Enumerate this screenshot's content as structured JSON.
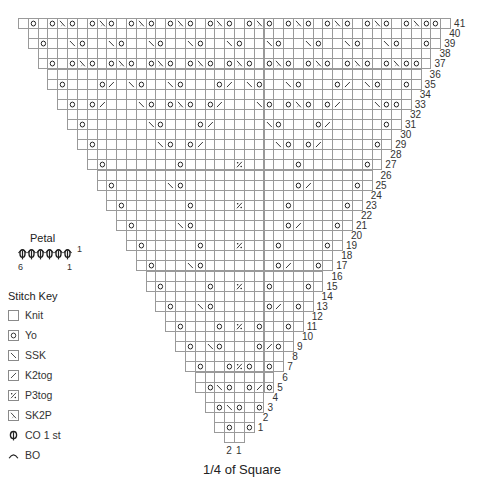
{
  "caption": "1/4 of Square",
  "petal": {
    "title": "Petal",
    "stitch_count": 6,
    "row_label": "1",
    "left_label": "6",
    "right_label": "1"
  },
  "stitch_key": {
    "title": "Stitch Key",
    "items": [
      {
        "symbol": "knit",
        "label": "Knit"
      },
      {
        "symbol": "yo",
        "label": "Yo"
      },
      {
        "symbol": "ssk",
        "label": "SSK"
      },
      {
        "symbol": "k2tog",
        "label": "K2tog"
      },
      {
        "symbol": "p3tog",
        "label": "P3tog"
      },
      {
        "symbol": "sk2p",
        "label": "SK2P"
      },
      {
        "symbol": "co1",
        "label": "CO 1 st"
      },
      {
        "symbol": "bo",
        "label": "BO"
      }
    ]
  },
  "chart": {
    "total_rows": 41,
    "bottom_row_cells": 2,
    "bottom_col_labels": [
      "2",
      "1"
    ],
    "symbols_legend": {
      "O": "yo",
      "S": "ssk",
      "K": "k2tog",
      "P": "p3tog",
      "X": "sk2p"
    },
    "rows": {
      "41": [
        [
          1,
          "O"
        ],
        [
          3,
          "O"
        ],
        [
          4,
          "X"
        ],
        [
          5,
          "O"
        ],
        [
          7,
          "O"
        ],
        [
          8,
          "X"
        ],
        [
          9,
          "O"
        ],
        [
          11,
          "O"
        ],
        [
          12,
          "X"
        ],
        [
          13,
          "O"
        ],
        [
          15,
          "O"
        ],
        [
          16,
          "X"
        ],
        [
          17,
          "O"
        ],
        [
          19,
          "O"
        ],
        [
          20,
          "X"
        ],
        [
          21,
          "O"
        ],
        [
          23,
          "O"
        ],
        [
          24,
          "X"
        ],
        [
          25,
          "O"
        ],
        [
          27,
          "O"
        ],
        [
          28,
          "X"
        ],
        [
          29,
          "O"
        ],
        [
          31,
          "O"
        ],
        [
          32,
          "X"
        ],
        [
          33,
          "O"
        ],
        [
          35,
          "O"
        ],
        [
          36,
          "X"
        ],
        [
          37,
          "O"
        ],
        [
          39,
          "O"
        ],
        [
          40,
          "X"
        ],
        [
          41,
          "O"
        ],
        [
          42,
          "O"
        ]
      ],
      "39": [
        [
          1,
          "O"
        ],
        [
          4,
          "S"
        ],
        [
          5,
          "O"
        ],
        [
          8,
          "S"
        ],
        [
          9,
          "O"
        ],
        [
          12,
          "S"
        ],
        [
          13,
          "O"
        ],
        [
          16,
          "S"
        ],
        [
          17,
          "O"
        ],
        [
          20,
          "S"
        ],
        [
          21,
          "O"
        ],
        [
          24,
          "S"
        ],
        [
          25,
          "O"
        ],
        [
          28,
          "S"
        ],
        [
          29,
          "O"
        ],
        [
          32,
          "S"
        ],
        [
          33,
          "O"
        ],
        [
          36,
          "S"
        ],
        [
          37,
          "O"
        ],
        [
          40,
          "O"
        ]
      ],
      "37": [
        [
          1,
          "O"
        ],
        [
          3,
          "O"
        ],
        [
          4,
          "X"
        ],
        [
          5,
          "O"
        ],
        [
          7,
          "O"
        ],
        [
          8,
          "X"
        ],
        [
          9,
          "O"
        ],
        [
          11,
          "O"
        ],
        [
          12,
          "X"
        ],
        [
          13,
          "O"
        ],
        [
          15,
          "O"
        ],
        [
          16,
          "X"
        ],
        [
          17,
          "O"
        ],
        [
          19,
          "O"
        ],
        [
          20,
          "X"
        ],
        [
          21,
          "O"
        ],
        [
          23,
          "O"
        ],
        [
          24,
          "X"
        ],
        [
          25,
          "O"
        ],
        [
          27,
          "O"
        ],
        [
          28,
          "X"
        ],
        [
          29,
          "O"
        ],
        [
          31,
          "O"
        ],
        [
          32,
          "X"
        ],
        [
          33,
          "O"
        ],
        [
          35,
          "O"
        ],
        [
          36,
          "X"
        ],
        [
          37,
          "O"
        ],
        [
          38,
          "O"
        ]
      ],
      "35": [
        [
          1,
          "O"
        ],
        [
          5,
          "O"
        ],
        [
          6,
          "K"
        ],
        [
          8,
          "S"
        ],
        [
          9,
          "O"
        ],
        [
          12,
          "S"
        ],
        [
          13,
          "O"
        ],
        [
          17,
          "O"
        ],
        [
          18,
          "K"
        ],
        [
          20,
          "S"
        ],
        [
          21,
          "O"
        ],
        [
          24,
          "S"
        ],
        [
          25,
          "O"
        ],
        [
          29,
          "O"
        ],
        [
          30,
          "K"
        ],
        [
          32,
          "S"
        ],
        [
          33,
          "O"
        ],
        [
          36,
          "O"
        ]
      ],
      "33": [
        [
          1,
          "O"
        ],
        [
          3,
          "O"
        ],
        [
          4,
          "K"
        ],
        [
          8,
          "S"
        ],
        [
          9,
          "O"
        ],
        [
          11,
          "O"
        ],
        [
          12,
          "X"
        ],
        [
          13,
          "O"
        ],
        [
          15,
          "O"
        ],
        [
          16,
          "K"
        ],
        [
          20,
          "S"
        ],
        [
          21,
          "O"
        ],
        [
          23,
          "O"
        ],
        [
          24,
          "X"
        ],
        [
          25,
          "O"
        ],
        [
          27,
          "O"
        ],
        [
          28,
          "K"
        ],
        [
          32,
          "S"
        ],
        [
          33,
          "O"
        ],
        [
          34,
          "O"
        ]
      ],
      "31": [
        [
          1,
          "O"
        ],
        [
          8,
          "S"
        ],
        [
          9,
          "O"
        ],
        [
          13,
          "O"
        ],
        [
          14,
          "K"
        ],
        [
          20,
          "S"
        ],
        [
          21,
          "O"
        ],
        [
          25,
          "O"
        ],
        [
          26,
          "K"
        ],
        [
          32,
          "O"
        ]
      ],
      "29": [
        [
          1,
          "O"
        ],
        [
          8,
          "S"
        ],
        [
          9,
          "O"
        ],
        [
          11,
          "O"
        ],
        [
          12,
          "K"
        ],
        [
          20,
          "S"
        ],
        [
          21,
          "O"
        ],
        [
          23,
          "O"
        ],
        [
          24,
          "K"
        ],
        [
          30,
          "O"
        ]
      ],
      "27": [
        [
          1,
          "O"
        ],
        [
          9,
          "O"
        ],
        [
          15,
          "P"
        ],
        [
          21,
          "O"
        ],
        [
          28,
          "O"
        ]
      ],
      "25": [
        [
          1,
          "O"
        ],
        [
          7,
          "S"
        ],
        [
          8,
          "O"
        ],
        [
          20,
          "O"
        ],
        [
          21,
          "K"
        ],
        [
          26,
          "O"
        ]
      ],
      "23": [
        [
          1,
          "O"
        ],
        [
          8,
          "O"
        ],
        [
          13,
          "P"
        ],
        [
          18,
          "O"
        ],
        [
          24,
          "O"
        ]
      ],
      "21": [
        [
          1,
          "O"
        ],
        [
          6,
          "S"
        ],
        [
          7,
          "O"
        ],
        [
          17,
          "O"
        ],
        [
          18,
          "K"
        ],
        [
          22,
          "O"
        ]
      ],
      "19": [
        [
          1,
          "O"
        ],
        [
          7,
          "O"
        ],
        [
          11,
          "P"
        ],
        [
          15,
          "O"
        ],
        [
          20,
          "O"
        ]
      ],
      "17": [
        [
          1,
          "O"
        ],
        [
          5,
          "S"
        ],
        [
          6,
          "O"
        ],
        [
          14,
          "O"
        ],
        [
          15,
          "K"
        ],
        [
          18,
          "O"
        ]
      ],
      "15": [
        [
          1,
          "O"
        ],
        [
          6,
          "O"
        ],
        [
          9,
          "P"
        ],
        [
          12,
          "O"
        ],
        [
          16,
          "O"
        ]
      ],
      "13": [
        [
          1,
          "O"
        ],
        [
          4,
          "S"
        ],
        [
          5,
          "O"
        ],
        [
          11,
          "O"
        ],
        [
          12,
          "K"
        ],
        [
          14,
          "O"
        ]
      ],
      "11": [
        [
          1,
          "O"
        ],
        [
          5,
          "O"
        ],
        [
          7,
          "P"
        ],
        [
          9,
          "O"
        ],
        [
          12,
          "O"
        ]
      ],
      "9": [
        [
          1,
          "O"
        ],
        [
          3,
          "S"
        ],
        [
          4,
          "O"
        ],
        [
          8,
          "O"
        ],
        [
          9,
          "K"
        ],
        [
          10,
          "O"
        ]
      ],
      "7": [
        [
          1,
          "O"
        ],
        [
          4,
          "O"
        ],
        [
          5,
          "P"
        ],
        [
          6,
          "O"
        ],
        [
          8,
          "O"
        ]
      ],
      "5": [
        [
          1,
          "O"
        ],
        [
          2,
          "S"
        ],
        [
          3,
          "O"
        ],
        [
          5,
          "O"
        ],
        [
          6,
          "K"
        ],
        [
          7,
          "O"
        ]
      ],
      "3": [
        [
          1,
          "O"
        ],
        [
          2,
          "S"
        ],
        [
          3,
          "O"
        ],
        [
          5,
          "O"
        ]
      ],
      "1": [
        [
          1,
          "O"
        ],
        [
          3,
          "O"
        ]
      ]
    }
  }
}
